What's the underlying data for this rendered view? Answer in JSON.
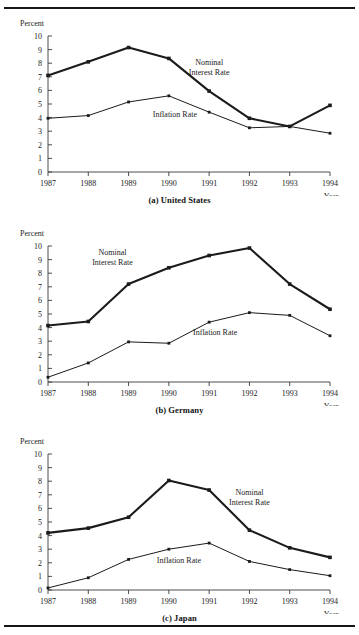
{
  "figure": {
    "top_rule": true,
    "bottom_rule": true,
    "line_color": "#1b1b1b",
    "axis_color": "#3a3a3a",
    "background": "#ffffff"
  },
  "chart_data": [
    {
      "type": "line",
      "id": "united-states",
      "title": "(a) United States",
      "xlabel": "Year",
      "ylabel": "Percent",
      "categories": [
        "1987",
        "1988",
        "1989",
        "1990",
        "1991",
        "1992",
        "1993",
        "1994"
      ],
      "x": [
        1987,
        1988,
        1989,
        1990,
        1991,
        1992,
        1993,
        1994
      ],
      "ylim": [
        0,
        10
      ],
      "yticks": [
        0,
        1,
        2,
        3,
        4,
        5,
        6,
        7,
        8,
        9,
        10
      ],
      "grid": false,
      "legend_position": "inline-annotation",
      "series": [
        {
          "name": "Nominal Interest Rate",
          "values": [
            7.1,
            8.1,
            9.15,
            8.35,
            5.95,
            3.95,
            3.35,
            4.9
          ],
          "stroke_width": 2.1,
          "label_x": 1991.0,
          "label_y": 7.9
        },
        {
          "name": "Inflation Rate",
          "values": [
            3.95,
            4.15,
            5.15,
            5.6,
            4.4,
            3.25,
            3.35,
            2.85
          ],
          "stroke_width": 1.0,
          "label_x": 1990.15,
          "label_y": 4.05
        }
      ]
    },
    {
      "type": "line",
      "id": "germany",
      "title": "(b) Germany",
      "xlabel": "Year",
      "ylabel": "Percent",
      "categories": [
        "1987",
        "1988",
        "1989",
        "1990",
        "1991",
        "1992",
        "1993",
        "1994"
      ],
      "x": [
        1987,
        1988,
        1989,
        1990,
        1991,
        1992,
        1993,
        1994
      ],
      "ylim": [
        0,
        10
      ],
      "yticks": [
        0,
        1,
        2,
        3,
        4,
        5,
        6,
        7,
        8,
        9,
        10
      ],
      "grid": false,
      "legend_position": "inline-annotation",
      "series": [
        {
          "name": "Nominal Interest Rate",
          "values": [
            4.15,
            4.45,
            7.2,
            8.4,
            9.3,
            9.85,
            7.2,
            5.35
          ],
          "stroke_width": 2.1,
          "label_x": 1988.6,
          "label_y": 9.35
        },
        {
          "name": "Inflation Rate",
          "values": [
            0.35,
            1.4,
            2.95,
            2.85,
            4.4,
            5.1,
            4.9,
            3.4
          ],
          "stroke_width": 1.0,
          "label_x": 1991.15,
          "label_y": 3.45
        }
      ]
    },
    {
      "type": "line",
      "id": "japan",
      "title": "(c) Japan",
      "xlabel": "Year",
      "ylabel": "Percent",
      "categories": [
        "1987",
        "1988",
        "1989",
        "1990",
        "1991",
        "1992",
        "1993",
        "1994"
      ],
      "x": [
        1987,
        1988,
        1989,
        1990,
        1991,
        1992,
        1993,
        1994
      ],
      "ylim": [
        0,
        10
      ],
      "yticks": [
        0,
        1,
        2,
        3,
        4,
        5,
        6,
        7,
        8,
        9,
        10
      ],
      "grid": false,
      "legend_position": "inline-annotation",
      "series": [
        {
          "name": "Nominal Interest Rate",
          "values": [
            4.2,
            4.55,
            5.35,
            8.05,
            7.35,
            4.4,
            3.1,
            2.4
          ],
          "stroke_width": 2.1,
          "label_x": 1992.0,
          "label_y": 6.95
        },
        {
          "name": "Inflation Rate",
          "values": [
            0.15,
            0.9,
            2.25,
            3.0,
            3.45,
            2.1,
            1.5,
            1.05
          ],
          "stroke_width": 1.0,
          "label_x": 1990.25,
          "label_y": 1.95
        }
      ]
    }
  ]
}
